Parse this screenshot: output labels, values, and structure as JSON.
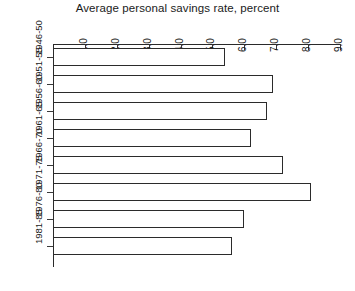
{
  "chart_data": {
    "type": "bar",
    "orientation": "horizontal",
    "title": "Average personal savings rate, percent",
    "xlabel": "",
    "ylabel": "",
    "categories": [
      "1946-50",
      "1951-55",
      "1956-60",
      "1961-65",
      "1966-70",
      "1971-75",
      "1976-80",
      "1981-85"
    ],
    "values": [
      5.4,
      6.9,
      6.7,
      6.2,
      7.2,
      8.1,
      6.0,
      5.6
    ],
    "xlim": [
      0.0,
      9.0
    ],
    "xticks": [
      "1.0",
      "2.0",
      "3.0",
      "4.0",
      "5.0",
      "6.0",
      "7.0",
      "8.0",
      "9.0"
    ],
    "xtick_values": [
      1.0,
      2.0,
      3.0,
      4.0,
      5.0,
      6.0,
      7.0,
      8.0,
      9.0
    ],
    "grid": false,
    "legend": null,
    "bar_fill_color": "#ffffff",
    "bar_border_color": "#2b2b2b",
    "axis_color": "#2a2a2a"
  }
}
